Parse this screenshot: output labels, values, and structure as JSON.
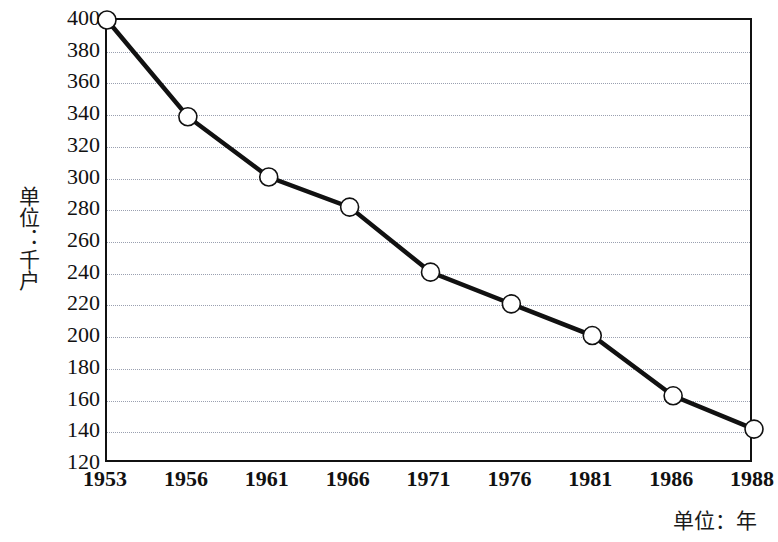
{
  "chart_data": {
    "type": "line",
    "title": "",
    "subtitle": "",
    "xlabel": "单位：年",
    "ylabel": "单位：千户",
    "categories": [
      "1953",
      "1956",
      "1961",
      "1966",
      "1971",
      "1976",
      "1981",
      "1986",
      "1988"
    ],
    "values": [
      400,
      339,
      301,
      282,
      241,
      221,
      201,
      163,
      142
    ],
    "series": [
      {
        "name": "",
        "values": [
          400,
          339,
          301,
          282,
          241,
          221,
          201,
          163,
          142
        ]
      }
    ],
    "ylim": [
      120,
      400
    ],
    "ytick_step": 20,
    "ytick_labels": [
      "400",
      "380",
      "360",
      "340",
      "320",
      "300",
      "280",
      "260",
      "240",
      "220",
      "200",
      "180",
      "160",
      "140",
      "120"
    ],
    "grid": true,
    "grid_axis": "y",
    "legend": "none",
    "marker": "open-circle",
    "line_color": "#111111",
    "marker_fill": "#ffffff",
    "marker_stroke": "#111111",
    "grid_color": "#9aa0b0",
    "axis_color": "#111111",
    "background": "#ffffff"
  }
}
